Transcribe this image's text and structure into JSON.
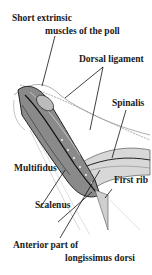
{
  "diagram": {
    "labels": [
      {
        "id": "short-extrinsic",
        "line1": "Short extrinsic",
        "line2": "muscles of the poll"
      },
      {
        "id": "dorsal-ligament",
        "text": "Dorsal ligament"
      },
      {
        "id": "spinalis",
        "text": "Spinalis"
      },
      {
        "id": "multifidus",
        "text": "Multifidus"
      },
      {
        "id": "first-rib",
        "text": "First rib"
      },
      {
        "id": "scalenus",
        "text": "Scalenus"
      },
      {
        "id": "anterior-longissimus",
        "line1": "Anterior part of",
        "line2": "longissimus dorsi"
      }
    ]
  }
}
